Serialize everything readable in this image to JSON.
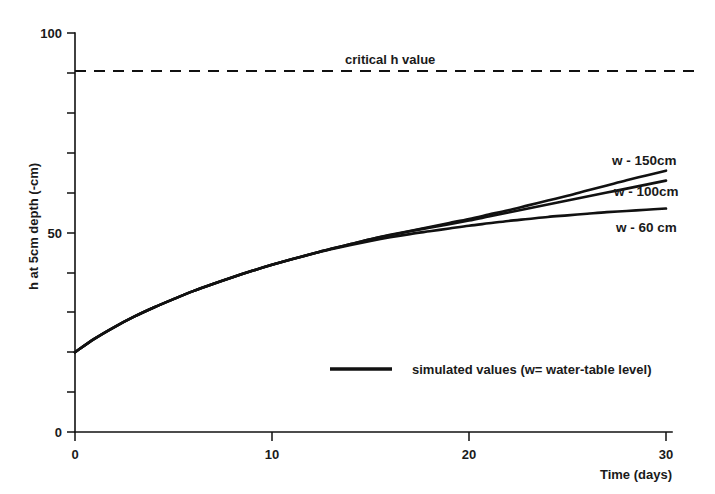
{
  "chart_data": {
    "type": "line",
    "title": "",
    "xlabel": "Time (days)",
    "ylabel": "h at 5cm depth (-cm)",
    "xlim": [
      0,
      30
    ],
    "ylim": [
      0,
      100
    ],
    "xticks": [
      0,
      10,
      20,
      30
    ],
    "xtick_labels": [
      "0",
      "10",
      "20",
      "30"
    ],
    "yticks": [
      0,
      10,
      20,
      30,
      40,
      50,
      60,
      70,
      80,
      90,
      100
    ],
    "ytick_labels": [
      "0",
      "",
      "",
      "",
      "",
      "50",
      "",
      "",
      "",
      "",
      "100"
    ],
    "grid": false,
    "legend_position": "inside-bottom-center",
    "legend_entries": [
      {
        "label": "simulated values (w= water-table level)",
        "style": "solid"
      }
    ],
    "annotations": [
      {
        "text": "critical h value",
        "x": 17.5,
        "y": 93,
        "kind": "threshold-label"
      }
    ],
    "threshold": {
      "label": "critical h value",
      "value": 90,
      "style": "dashed"
    },
    "x": [
      0,
      1,
      2,
      3,
      4,
      5,
      6,
      7,
      8,
      9,
      10,
      11,
      12,
      13,
      14,
      15,
      16,
      17,
      18,
      19,
      20,
      21,
      22,
      23,
      24,
      25,
      26,
      27,
      28,
      29,
      30
    ],
    "series": [
      {
        "name": "w - 150cm",
        "label": "w - 150cm",
        "values": [
          20.0,
          23.4,
          26.3,
          28.9,
          31.2,
          33.3,
          35.3,
          37.1,
          38.8,
          40.4,
          41.9,
          43.3,
          44.6,
          45.9,
          47.1,
          48.3,
          49.4,
          50.4,
          51.4,
          52.4,
          53.4,
          54.5,
          55.6,
          56.8,
          58.0,
          59.2,
          60.5,
          61.8,
          63.1,
          64.3,
          65.5
        ]
      },
      {
        "name": "w - 100cm",
        "label": "w - 100cm",
        "values": [
          20.0,
          23.4,
          26.3,
          28.9,
          31.2,
          33.3,
          35.3,
          37.1,
          38.8,
          40.4,
          41.9,
          43.3,
          44.6,
          45.9,
          47.1,
          48.3,
          49.3,
          50.3,
          51.2,
          52.1,
          53.0,
          54.0,
          55.0,
          56.0,
          57.0,
          58.0,
          59.0,
          60.0,
          61.0,
          62.0,
          63.0
        ]
      },
      {
        "name": "w - 60 cm",
        "label": "w - 60 cm",
        "values": [
          20.0,
          23.4,
          26.3,
          28.9,
          31.2,
          33.3,
          35.3,
          37.1,
          38.8,
          40.4,
          41.9,
          43.3,
          44.6,
          45.8,
          46.9,
          47.9,
          48.8,
          49.6,
          50.3,
          51.0,
          51.7,
          52.3,
          52.9,
          53.4,
          53.9,
          54.3,
          54.7,
          55.1,
          55.4,
          55.7,
          56.0
        ]
      }
    ]
  },
  "axes": {
    "y_axis_title": "h at 5cm depth (-cm)",
    "x_axis_title": "Time (days)",
    "y_top_label": "100",
    "y_mid_label": "50",
    "y_zero_label": "0",
    "x_zero_label": "0",
    "x_ten_label": "10",
    "x_twenty_label": "20",
    "x_thirty_label": "30"
  },
  "labels": {
    "critical": "critical h value",
    "series_150": "w - 150cm",
    "series_100": "w - 100cm",
    "series_60": "w - 60 cm",
    "legend": "simulated values (w= water-table level)"
  },
  "colors": {
    "ink": "#111111",
    "background": "#ffffff"
  }
}
